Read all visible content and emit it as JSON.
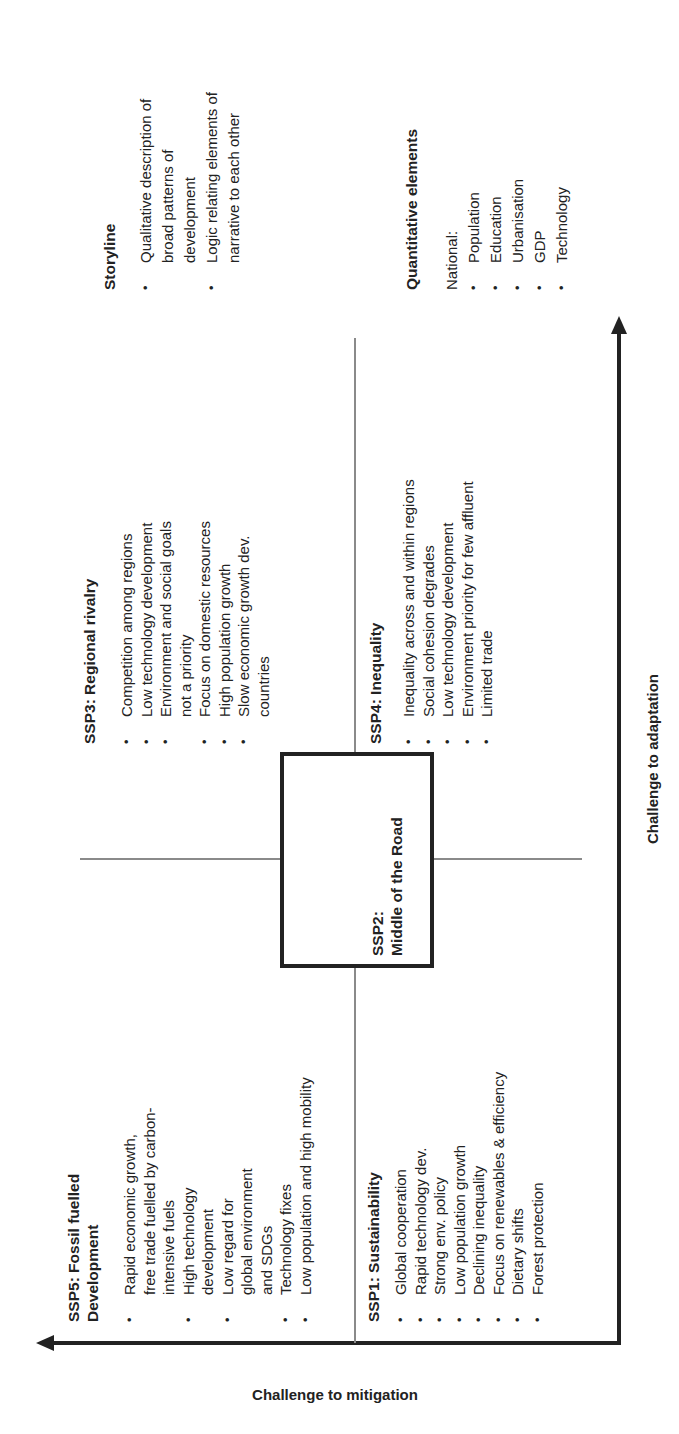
{
  "orientation": "rotated 90 degrees counter-clockwise",
  "axes": {
    "y_label": "Challenge to mitigation",
    "x_label": "Challenge to adaptation"
  },
  "quadrants": {
    "ssp5": {
      "title_line1": "SSP5: Fossil fuelled",
      "title_line2": "Development",
      "items": [
        "Rapid economic growth, free trade fuelled by carbon-intensive fuels",
        "High technology development",
        "Low regard for global environment and SDGs",
        "Technology  fixes",
        "Low population and high mobility"
      ]
    },
    "ssp3": {
      "title": "SSP3: Regional rivalry",
      "items": [
        "Competition among regions",
        "Low technology development",
        "Environment and social goals not a priority",
        "Focus on domestic resources",
        "High population growth",
        "Slow economic growth dev. countries"
      ]
    },
    "ssp1": {
      "title": "SSP1: Sustainability",
      "items": [
        "Global cooperation",
        "Rapid technology dev.",
        "Strong env. policy",
        "Low population growth",
        "Declining inequality",
        "Focus on renewables & efficiency",
        "Dietary shifts",
        "Forest protection"
      ]
    },
    "ssp4": {
      "title": "SSP4: Inequality",
      "items": [
        "Inequality across and within regions",
        "Social cohesion degrades",
        "Low technology development",
        "Environment priority for few affluent",
        "Limited trade"
      ]
    }
  },
  "center": {
    "line1": "SSP2:",
    "line2": "Middle of the Road"
  },
  "storyline": {
    "title": "Storyline",
    "items": [
      "Qualitative description of broad patterns of development",
      "Logic relating elements of narrative to each other"
    ]
  },
  "quantitative": {
    "title": "Quantitative elements",
    "intro": "National:",
    "items": [
      "Population",
      "Education",
      "Urbanisation",
      "GDP",
      "Technology"
    ]
  },
  "colors": {
    "ink": "#222222",
    "divider": "#8a8a8a",
    "background": "#ffffff"
  }
}
